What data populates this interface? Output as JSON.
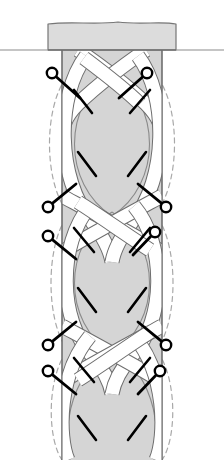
{
  "figure": {
    "title": "Braided band longitudinal diagram",
    "caption": "",
    "width": 224,
    "height": 460,
    "background_color": "#ffffff"
  },
  "colors": {
    "background": "#ffffff",
    "body_fill": "#d5d5d5",
    "body_fill_light": "#dcdcdc",
    "ribbon_fill": "#ffffff",
    "outline_stroke": "#6e6e6e",
    "outline_stroke_dark": "#555555",
    "dashed_stroke": "#a8a8a8",
    "pin_stroke": "#000000",
    "pin_fill": "#ffffff",
    "ground_line": "#8c8c8c"
  },
  "geometry": {
    "axis_x": 112,
    "column_left": 62,
    "column_right": 162,
    "column_top": 50,
    "column_bottom": 460,
    "cap": {
      "left": 48,
      "right": 176,
      "top": 22,
      "bottom": 50,
      "stem_left": 62,
      "stem_right": 162
    },
    "ground_line_y": 50,
    "ground_left_start": 0,
    "ground_right_end": 224,
    "node_y": [
      68,
      218,
      348,
      460
    ],
    "lens_centers_y": [
      143,
      283,
      404
    ],
    "ribbon_width": 13,
    "dash_pattern": "5 4"
  },
  "ribbons": [
    {
      "id": "ribbon-left-strand",
      "label": "left strand",
      "over_at": [
        0,
        2
      ]
    },
    {
      "id": "ribbon-right-strand",
      "label": "right strand",
      "over_at": [
        1,
        3
      ]
    }
  ],
  "dashed_outlines": [
    {
      "id": "dashed-left-upper",
      "side": "left",
      "level": 1
    },
    {
      "id": "dashed-right-upper",
      "side": "right",
      "level": 1
    },
    {
      "id": "dashed-left-lower",
      "side": "left",
      "level": 2
    },
    {
      "id": "dashed-right-lower",
      "side": "right",
      "level": 2
    },
    {
      "id": "dashed-left-bottom",
      "side": "left",
      "level": 3
    },
    {
      "id": "dashed-right-bottom",
      "side": "right",
      "level": 3
    }
  ],
  "pins": [
    {
      "id": "pin-1",
      "side": "left",
      "circle": [
        52,
        73
      ],
      "tip": [
        80,
        98
      ],
      "label": ""
    },
    {
      "id": "pin-2",
      "side": "right",
      "circle": [
        147,
        73
      ],
      "tip": [
        119,
        98
      ],
      "label": ""
    },
    {
      "id": "pin-3",
      "side": "left",
      "circle": [
        48,
        207
      ],
      "tip": [
        76,
        184
      ],
      "label": ""
    },
    {
      "id": "pin-4",
      "side": "left",
      "circle": [
        48,
        236
      ],
      "tip": [
        76,
        259
      ],
      "label": ""
    },
    {
      "id": "pin-5",
      "side": "right",
      "circle": [
        166,
        207
      ],
      "tip": [
        138,
        184
      ],
      "label": ""
    },
    {
      "id": "pin-6",
      "side": "right",
      "circle": [
        155,
        232
      ],
      "tip": [
        133,
        255
      ],
      "label": ""
    },
    {
      "id": "pin-7",
      "side": "left",
      "circle": [
        48,
        345
      ],
      "tip": [
        76,
        322
      ],
      "label": ""
    },
    {
      "id": "pin-8",
      "side": "left",
      "circle": [
        48,
        371
      ],
      "tip": [
        76,
        394
      ],
      "label": ""
    },
    {
      "id": "pin-9",
      "side": "right",
      "circle": [
        166,
        345
      ],
      "tip": [
        138,
        322
      ],
      "label": ""
    },
    {
      "id": "pin-10",
      "side": "right",
      "circle": [
        160,
        371
      ],
      "tip": [
        138,
        394
      ],
      "label": ""
    }
  ],
  "leader_ticks": [
    {
      "id": "tick-1",
      "from": [
        74,
        90
      ],
      "to": [
        92,
        113
      ]
    },
    {
      "id": "tick-2",
      "from": [
        150,
        90
      ],
      "to": [
        130,
        113
      ]
    },
    {
      "id": "tick-3",
      "from": [
        96,
        176
      ],
      "to": [
        78,
        152
      ]
    },
    {
      "id": "tick-4",
      "from": [
        128,
        176
      ],
      "to": [
        146,
        152
      ]
    },
    {
      "id": "tick-5",
      "from": [
        74,
        228
      ],
      "to": [
        94,
        252
      ]
    },
    {
      "id": "tick-6",
      "from": [
        150,
        228
      ],
      "to": [
        130,
        252
      ]
    },
    {
      "id": "tick-7",
      "from": [
        96,
        312
      ],
      "to": [
        78,
        288
      ]
    },
    {
      "id": "tick-8",
      "from": [
        128,
        312
      ],
      "to": [
        146,
        288
      ]
    },
    {
      "id": "tick-9",
      "from": [
        74,
        358
      ],
      "to": [
        94,
        382
      ]
    },
    {
      "id": "tick-10",
      "from": [
        150,
        358
      ],
      "to": [
        130,
        382
      ]
    },
    {
      "id": "tick-11",
      "from": [
        96,
        440
      ],
      "to": [
        78,
        416
      ]
    },
    {
      "id": "tick-12",
      "from": [
        128,
        440
      ],
      "to": [
        146,
        416
      ]
    }
  ],
  "chart_data": {
    "type": "diagram",
    "title": "Braided band longitudinal diagram",
    "elements": {
      "cap_blocks": 1,
      "lens_openings": 3,
      "crossing_nodes": 4,
      "pin_markers": 10,
      "leader_ticks": 12,
      "dashed_contours": 6
    }
  }
}
